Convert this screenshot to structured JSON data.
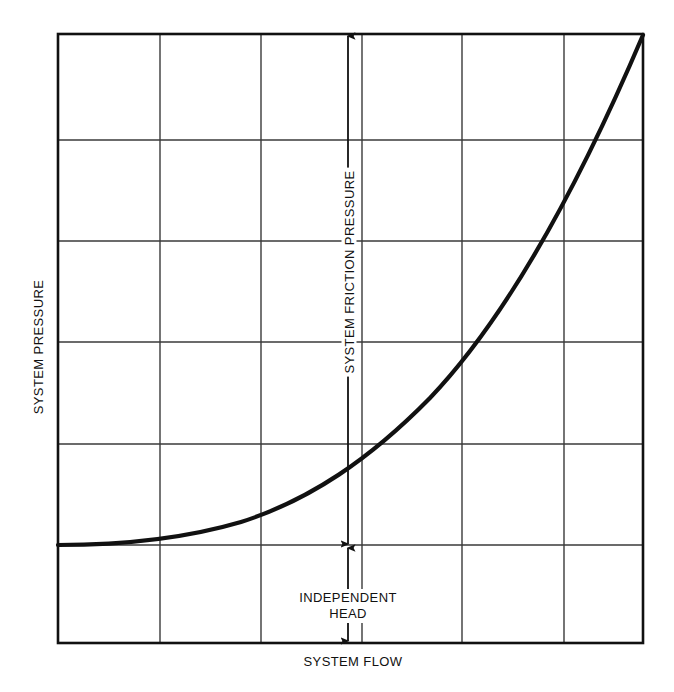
{
  "figure": {
    "width": 674,
    "height": 692,
    "background": "#ffffff",
    "line_color": "#111111",
    "grid_color": "#3a3a3a",
    "border_color": "#111111"
  },
  "labels": {
    "y_axis": "SYSTEM PRESSURE",
    "x_axis": "SYSTEM FLOW",
    "friction_annotation": "SYSTEM FRICTION PRESSURE",
    "head_annotation_line1": "INDEPENDENT",
    "head_annotation_line2": "HEAD"
  },
  "chart_data": {
    "type": "line",
    "title": "",
    "xlabel": "SYSTEM FLOW",
    "ylabel": "SYSTEM PRESSURE",
    "xlim": [
      0,
      6
    ],
    "ylim": [
      0,
      6
    ],
    "grid": true,
    "x_ticks": [
      0,
      1,
      2,
      3,
      4,
      5,
      6
    ],
    "y_ticks": [
      0,
      1,
      2,
      3,
      4,
      5,
      6
    ],
    "x_tick_labels": [
      "",
      "",
      "",
      "",
      "",
      "",
      ""
    ],
    "y_tick_labels": [
      "",
      "",
      "",
      "",
      "",
      "",
      ""
    ],
    "legend": null,
    "series": [
      {
        "name": "system curve",
        "x": [
          0.0,
          0.5,
          1.0,
          1.5,
          2.0,
          2.5,
          3.0,
          3.5,
          4.0,
          4.5,
          5.0,
          5.5,
          6.0
        ],
        "y": [
          0.96,
          0.99,
          1.07,
          1.21,
          1.41,
          1.67,
          1.99,
          2.37,
          2.81,
          3.31,
          3.87,
          4.49,
          5.17
        ]
      }
    ],
    "annotations": [
      {
        "text": "SYSTEM FRICTION PRESSURE",
        "type": "double-arrow-vertical",
        "x": 3.0,
        "y_from": 0.96,
        "y_to": 6.0,
        "orientation": "vertical",
        "rotation": -90
      },
      {
        "text": "INDEPENDENT HEAD",
        "type": "double-arrow-vertical",
        "x": 3.0,
        "y_from": 0.0,
        "y_to": 0.96,
        "orientation": "vertical",
        "rotation": 0
      }
    ]
  },
  "geometry": {
    "plot_left": 58,
    "plot_top": 34,
    "plot_right": 643,
    "plot_bottom": 643,
    "v_gridlines": [
      160,
      261,
      362,
      462,
      564
    ],
    "h_gridlines": [
      140,
      241,
      342,
      444,
      545
    ],
    "curve_path": "M 58 545 C 120 545, 180 540, 241 522 C 310 500, 370 459, 430 398 C 490 335, 560 230, 643 35",
    "friction_arrow": {
      "x": 348,
      "y_top": 36,
      "y_bottom": 544
    },
    "head_arrow": {
      "x": 348,
      "y_top": 548,
      "y_bottom": 641
    }
  }
}
